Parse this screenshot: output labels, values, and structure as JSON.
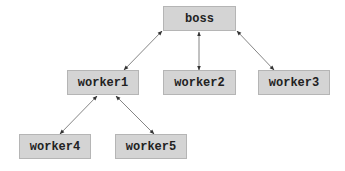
{
  "diagram": {
    "type": "tree",
    "nodes": [
      {
        "id": "boss",
        "label": "boss",
        "x": 163,
        "y": 6,
        "w": 73,
        "h": 25
      },
      {
        "id": "worker1",
        "label": "worker1",
        "x": 67,
        "y": 70,
        "w": 72,
        "h": 25
      },
      {
        "id": "worker2",
        "label": "worker2",
        "x": 163,
        "y": 70,
        "w": 73,
        "h": 25
      },
      {
        "id": "worker3",
        "label": "worker3",
        "x": 258,
        "y": 70,
        "w": 72,
        "h": 25
      },
      {
        "id": "worker4",
        "label": "worker4",
        "x": 19,
        "y": 134,
        "w": 72,
        "h": 25
      },
      {
        "id": "worker5",
        "label": "worker5",
        "x": 115,
        "y": 134,
        "w": 72,
        "h": 25
      }
    ],
    "edges": [
      {
        "from": "boss",
        "to": "worker1",
        "bidirectional": true
      },
      {
        "from": "boss",
        "to": "worker2",
        "bidirectional": true
      },
      {
        "from": "boss",
        "to": "worker3",
        "bidirectional": true
      },
      {
        "from": "worker1",
        "to": "worker4",
        "bidirectional": true
      },
      {
        "from": "worker1",
        "to": "worker5",
        "bidirectional": true
      }
    ],
    "colors": {
      "node_fill": "#d4d4d4",
      "node_border": "#b5b5b5",
      "edge": "#555555"
    }
  }
}
